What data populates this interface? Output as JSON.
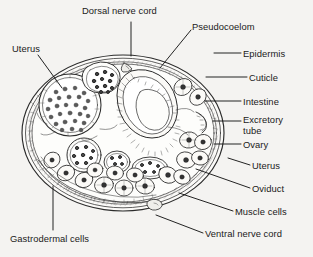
{
  "figure": {
    "background_color": "#f4f3f1",
    "ink_color": "#2b2b2b",
    "width": 313,
    "height": 257
  },
  "labels": [
    {
      "id": "dorsal-nerve-cord",
      "text": "Dorsal nerve cord",
      "x": 82,
      "y": 6,
      "align": "left"
    },
    {
      "id": "pseudocoelom",
      "text": "Pseudocoelom",
      "x": 192,
      "y": 22,
      "align": "left"
    },
    {
      "id": "uterus-left",
      "text": "Uterus",
      "x": 12,
      "y": 44,
      "align": "left"
    },
    {
      "id": "epidermis",
      "text": "Epidermis",
      "x": 243,
      "y": 49,
      "align": "left"
    },
    {
      "id": "cuticle",
      "text": "Cuticle",
      "x": 249,
      "y": 73,
      "align": "left"
    },
    {
      "id": "intestine",
      "text": "Intestine",
      "x": 243,
      "y": 97,
      "align": "left"
    },
    {
      "id": "excretory-tube",
      "text": "Excretory\ntube",
      "x": 243,
      "y": 115,
      "align": "left"
    },
    {
      "id": "ovary",
      "text": "Ovary",
      "x": 243,
      "y": 140,
      "align": "left"
    },
    {
      "id": "uterus-right",
      "text": "Uterus",
      "x": 252,
      "y": 161,
      "align": "left"
    },
    {
      "id": "oviduct",
      "text": "Oviduct",
      "x": 252,
      "y": 184,
      "align": "left"
    },
    {
      "id": "muscle-cells",
      "text": "Muscle cells",
      "x": 235,
      "y": 207,
      "align": "left"
    },
    {
      "id": "ventral-nerve-cord",
      "text": "Ventral nerve cord",
      "x": 205,
      "y": 229,
      "align": "left"
    },
    {
      "id": "gastrodermal-cells",
      "text": "Gastrodermal cells",
      "x": 10,
      "y": 234,
      "align": "left"
    }
  ],
  "leader_lines": [
    {
      "id": "leader-dorsal-nerve-cord",
      "points": "131,22 131,56"
    },
    {
      "id": "leader-pseudocoelom",
      "points": "191,30 160,68"
    },
    {
      "id": "leader-uterus-left",
      "points": "38,55 62,88"
    },
    {
      "id": "leader-epidermis",
      "points": "241,53 214,53"
    },
    {
      "id": "leader-cuticle",
      "points": "247,77 206,77"
    },
    {
      "id": "leader-intestine",
      "points": "241,101 205,101"
    },
    {
      "id": "leader-excretory-tube",
      "points": "241,121 213,121"
    },
    {
      "id": "leader-ovary",
      "points": "241,144 214,144"
    },
    {
      "id": "leader-uterus-right",
      "points": "250,165 228,158"
    },
    {
      "id": "leader-oviduct",
      "points": "250,188 196,169"
    },
    {
      "id": "leader-muscle-cells",
      "points": "233,211 179,193"
    },
    {
      "id": "leader-ventral-nerve-cord",
      "points": "203,233 156,215"
    },
    {
      "id": "leader-gastrodermal-cells",
      "points": "53,230 53,186"
    }
  ],
  "anatomy": {
    "body_outline": "outer cuticle oval",
    "structures": [
      "cuticle",
      "epidermis",
      "muscle-cell-band",
      "pseudocoelom",
      "intestine-lumen",
      "dorsal-nerve-cord",
      "ventral-nerve-cord",
      "excretory-tube",
      "uterus",
      "ovary",
      "oviduct",
      "gastrodermal-cells"
    ]
  }
}
